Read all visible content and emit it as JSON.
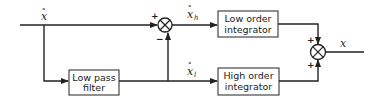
{
  "diagram": {
    "type": "block-diagram",
    "blocks": {
      "low_pass": {
        "line1": "Low pass",
        "line2": "filter"
      },
      "low_order": {
        "line1": "Low order",
        "line2": "integrator"
      },
      "high_order": {
        "line1": "High order",
        "line2": "integrator"
      }
    },
    "signals": {
      "input": {
        "symbol": "x",
        "dot": "°"
      },
      "high": {
        "symbol": "x",
        "sub": "h",
        "dot": "°"
      },
      "low": {
        "symbol": "x",
        "sub": "l",
        "dot": "°"
      },
      "output": {
        "symbol": "x"
      }
    },
    "junctions": {
      "first": {
        "top_sign": "+",
        "bottom_sign": "−"
      },
      "second": {
        "top_sign": "+",
        "bottom_sign": "+"
      }
    },
    "colors": {
      "line": "#222222",
      "box_fill": "#ffffff"
    }
  }
}
